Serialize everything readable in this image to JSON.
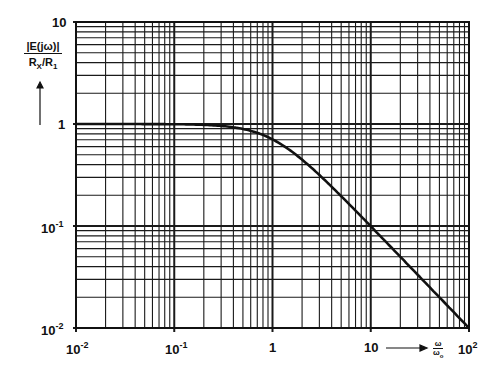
{
  "chart_data": {
    "type": "line",
    "title": "",
    "xlabel": "ω/ω₀",
    "ylabel": "|E(jω)| / (Rx/R1)",
    "xscale": "log",
    "yscale": "log",
    "xlim": [
      0.01,
      100
    ],
    "ylim": [
      0.01,
      10
    ],
    "grid": true,
    "legend": null,
    "x_ticks": [
      "10^-2",
      "10^-1",
      "1",
      "10",
      "10^2"
    ],
    "y_ticks": [
      "10^-2",
      "10^-1",
      "1",
      "10"
    ],
    "series": [
      {
        "name": "|E(jω)|/(Rx/R1)",
        "x": [
          0.01,
          0.03,
          0.1,
          0.2,
          0.3,
          0.5,
          0.7,
          1,
          1.5,
          2,
          3,
          5,
          7,
          10,
          20,
          30,
          50,
          70,
          100
        ],
        "values": [
          1.0,
          1.0,
          0.995,
          0.981,
          0.958,
          0.894,
          0.819,
          0.707,
          0.555,
          0.447,
          0.316,
          0.196,
          0.141,
          0.0995,
          0.05,
          0.0333,
          0.02,
          0.0143,
          0.01
        ]
      }
    ],
    "annotations": [
      "first-order low-pass: 1/sqrt(1+(ω/ω₀)²)",
      "-20 dB/decade above ω₀"
    ]
  },
  "labels": {
    "y_top": "10",
    "y_one": "1",
    "y_m1_base": "10",
    "y_m1_exp": "-1",
    "y_m2_base": "10",
    "y_m2_exp": "-2",
    "x_m2_base": "10",
    "x_m2_exp": "-2",
    "x_m1_base": "10",
    "x_m1_exp": "-1",
    "x_one": "1",
    "x_ten": "10",
    "x_100_base": "10",
    "x_100_exp": "2",
    "ylabel_num": "|E(jω)|",
    "ylabel_den_a": "R",
    "ylabel_den_a_sub": "X",
    "ylabel_den_b": "/R",
    "ylabel_den_b_sub": "1",
    "xunit_num": "ω",
    "xunit_den": "ω",
    "xunit_den_sub": "o"
  }
}
